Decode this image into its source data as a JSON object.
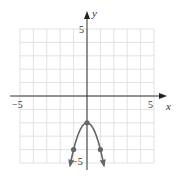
{
  "chart_data": {
    "type": "line",
    "title": "",
    "xlabel": "x",
    "ylabel": "y",
    "xlim": [
      -5,
      5
    ],
    "ylim": [
      -5,
      5
    ],
    "grid": true,
    "x_tick_labels": [
      "-5",
      "5"
    ],
    "y_tick_labels": [
      "5",
      "-5"
    ],
    "function": "y = -2x^2 - 2",
    "series": [
      {
        "name": "parabola",
        "x": [
          -1.5,
          -1,
          -0.5,
          0,
          0.5,
          1,
          1.5
        ],
        "y": [
          -6.5,
          -4,
          -2.5,
          -2,
          -2.5,
          -4,
          -6.5
        ]
      }
    ],
    "marked_points": [
      {
        "x": -1,
        "y": -4
      },
      {
        "x": 0,
        "y": -2
      },
      {
        "x": 1,
        "y": -4
      }
    ],
    "colors": {
      "curve": "#666666",
      "grid": "#e2e2e2",
      "axis": "#333333"
    }
  },
  "labels": {
    "x_axis": "x",
    "y_axis": "y",
    "x_min": "−5",
    "x_max": "5",
    "y_max": "5",
    "y_min": "−5"
  }
}
